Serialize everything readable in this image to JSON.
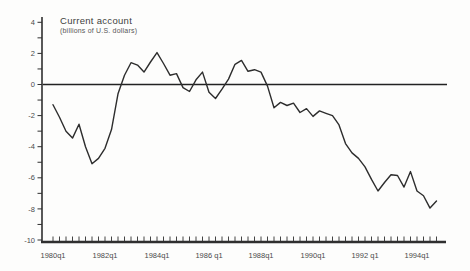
{
  "page": {
    "background": "#fdfdfc"
  },
  "chart": {
    "title": "Current account",
    "subtitle": "(billions of U.S. dollars)"
  },
  "chart_data": {
    "type": "line",
    "title": "Current account",
    "subtitle": "(billions of U.S. dollars)",
    "xlabel": "",
    "ylabel": "",
    "x_unit": "quarter",
    "grid": "off",
    "zero_line": true,
    "legend": "none",
    "ylim": [
      -10,
      4
    ],
    "y_major_ticks": [
      4,
      2,
      0,
      -2,
      -4,
      -6,
      -8,
      -10
    ],
    "y_minor_tick_step": 1,
    "x_tick_label_every": 8,
    "x_tick_labels": [
      "1980q1",
      "1982q1",
      "1984q1",
      "1986 q1",
      "1988q1",
      "1990q1",
      "1992 q1",
      "1994q1"
    ],
    "categories": [
      "1980q1",
      "1980q2",
      "1980q3",
      "1980q4",
      "1981q1",
      "1981q2",
      "1981q3",
      "1981q4",
      "1982q1",
      "1982q2",
      "1982q3",
      "1982q4",
      "1983q1",
      "1983q2",
      "1983q3",
      "1983q4",
      "1984q1",
      "1984q2",
      "1984q3",
      "1984q4",
      "1985q1",
      "1985q2",
      "1985q3",
      "1985q4",
      "1986q1",
      "1986q2",
      "1986q3",
      "1986q4",
      "1987q1",
      "1987q2",
      "1987q3",
      "1987q4",
      "1988q1",
      "1988q2",
      "1988q3",
      "1988q4",
      "1989q1",
      "1989q2",
      "1989q3",
      "1989q4",
      "1990q1",
      "1990q2",
      "1990q3",
      "1990q4",
      "1991q1",
      "1991q2",
      "1991q3",
      "1991q4",
      "1992q1",
      "1992q2",
      "1992q3",
      "1992q4",
      "1993q1",
      "1993q2",
      "1993q3",
      "1993q4",
      "1994q1",
      "1994q2",
      "1994q3",
      "1994q4"
    ],
    "series": [
      {
        "name": "Current account",
        "values": [
          -1.3,
          -2.1,
          -3.0,
          -3.45,
          -2.55,
          -4.0,
          -5.1,
          -4.75,
          -4.1,
          -2.9,
          -0.6,
          0.6,
          1.4,
          1.25,
          0.8,
          1.45,
          2.05,
          1.35,
          0.6,
          0.7,
          -0.2,
          -0.45,
          0.3,
          0.8,
          -0.5,
          -0.9,
          -0.3,
          0.35,
          1.3,
          1.55,
          0.85,
          0.95,
          0.8,
          -0.1,
          -1.5,
          -1.15,
          -1.35,
          -1.2,
          -1.8,
          -1.55,
          -2.05,
          -1.7,
          -1.85,
          -2.0,
          -2.6,
          -3.8,
          -4.4,
          -4.75,
          -5.3,
          -6.1,
          -6.85,
          -6.3,
          -5.8,
          -5.85,
          -6.6,
          -5.6,
          -6.85,
          -7.15,
          -7.95,
          -7.5
        ]
      }
    ],
    "colors": {
      "line": "#2d2d2d",
      "axis": "#2f2f2f",
      "zero_line": "#222222",
      "text": "#4a4a4a"
    }
  }
}
